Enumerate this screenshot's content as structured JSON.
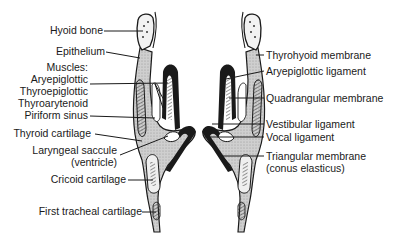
{
  "diagram": {
    "left_labels": {
      "hyoid_bone": "Hyoid bone",
      "epithelium": "Epithelium",
      "muscles_heading": "Muscles:",
      "aryepiglottic": "Aryepiglottic",
      "thyroepiglottic": "Thyroepiglottic",
      "thyroarytenoid": "Thyroarytenoid",
      "piriform_sinus": "Piriform sinus",
      "thyroid_cartilage": "Thyroid cartilage",
      "laryngeal_saccule": "Laryngeal saccule",
      "laryngeal_saccule_sub": "(ventricle)",
      "cricoid_cartilage": "Cricoid cartilage",
      "first_tracheal_cartilage": "First tracheal cartilage"
    },
    "right_labels": {
      "thyrohyoid_membrane": "Thyrohyoid membrane",
      "aryepiglottic_ligament": "Aryepiglottic ligament",
      "quadrangular_membrane": "Quadrangular membrane",
      "vestibular_ligament": "Vestibular ligament",
      "vocal_ligament": "Vocal ligament",
      "triangular_membrane": "Triangular membrane",
      "triangular_membrane_sub": "(conus elasticus)"
    },
    "colors": {
      "ink": "#1a1a1a",
      "tissue_fill": "#c9c9c9",
      "cartilage_fill": "#e6e6e6",
      "background": "#ffffff"
    }
  }
}
